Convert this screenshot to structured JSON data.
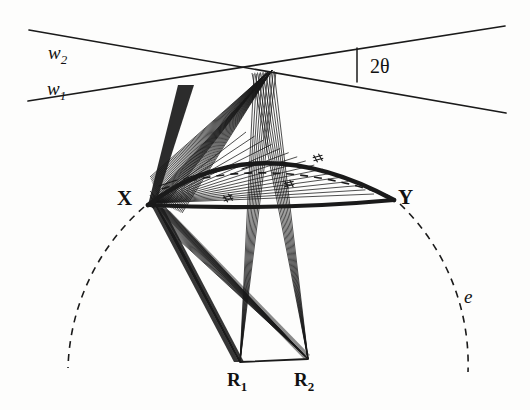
{
  "figure": {
    "background_color": "#fdfdfc",
    "ink_color": "#1a1a1a"
  },
  "labels": {
    "w2": {
      "base": "w",
      "subscript": "2",
      "x": 48,
      "y": 42,
      "style": "italic"
    },
    "w1": {
      "base": "w",
      "subscript": "1",
      "x": 47,
      "y": 78,
      "style": "italic"
    },
    "two_theta": {
      "text": "2θ",
      "x": 370,
      "y": 55,
      "style": "upright"
    },
    "X": {
      "text": "X",
      "x": 117,
      "y": 186,
      "style": "bold"
    },
    "Y": {
      "text": "Y",
      "x": 398,
      "y": 185,
      "style": "bold"
    },
    "R1": {
      "base": "R",
      "subscript": "1",
      "x": 227,
      "y": 369,
      "style": "bold"
    },
    "R2": {
      "base": "R",
      "subscript": "2",
      "x": 294,
      "y": 369,
      "style": "bold"
    },
    "e": {
      "text": "e",
      "x": 464,
      "y": 286,
      "style": "italic"
    }
  },
  "geometry": {
    "crossing_point": {
      "x": 272,
      "y": 70
    },
    "point_X": {
      "x": 148,
      "y": 205
    },
    "point_Y": {
      "x": 394,
      "y": 200
    },
    "point_R1": {
      "x": 240,
      "y": 362
    },
    "point_R2": {
      "x": 308,
      "y": 359
    },
    "beam_w2": {
      "x1": 29,
      "y1": 30,
      "x2": 506,
      "y2": 113
    },
    "beam_w1": {
      "x1": 28,
      "y1": 101,
      "x2": 505,
      "y2": 26
    },
    "angle_tick": {
      "x": 357,
      "y1": 48,
      "y2": 82
    },
    "chord_XY": {
      "x1": 148,
      "y1": 205,
      "x2": 394,
      "y2": 200
    },
    "arc_apex": {
      "x": 272,
      "y": 130
    },
    "dashed_circle": {
      "cx": 272,
      "cy": 92,
      "r": 222
    },
    "dashed_inner_chord_apex": {
      "x": 268,
      "y": 163
    },
    "fan_count_upper": 22,
    "fan_count_R1": 20,
    "fan_count_R2": 20
  },
  "hatch_marks": [
    {
      "x": 228,
      "y": 198,
      "rot": -18
    },
    {
      "x": 289,
      "y": 184,
      "rot": -12
    },
    {
      "x": 318,
      "y": 158,
      "rot": -15
    }
  ],
  "tick_marks_on_dashed_chord": [
    {
      "x": 168,
      "y": 183
    },
    {
      "x": 193,
      "y": 176
    },
    {
      "x": 222,
      "y": 170
    },
    {
      "x": 251,
      "y": 166
    }
  ]
}
